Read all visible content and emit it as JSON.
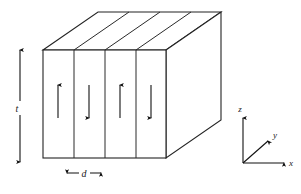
{
  "figure": {
    "type": "magnetic-domain-slab-diagram",
    "background_color": "#ffffff",
    "line_color": "#232323"
  },
  "labels": {
    "thickness": "t",
    "domain_width": "d",
    "axis_x": "x",
    "axis_y": "y",
    "axis_z": "z"
  },
  "slab": {
    "front_face": {
      "left_x": 43,
      "right_x": 166,
      "top_y": 50,
      "bottom_y": 158
    },
    "depth_offset": {
      "dx": 55,
      "dy": -38
    },
    "domain_boundaries_x": [
      43,
      74,
      105,
      136,
      166
    ],
    "domain_count": 4
  },
  "domains": [
    {
      "index": 1,
      "center_x": 58,
      "direction": "up",
      "arrow_symbol": "↑"
    },
    {
      "index": 2,
      "center_x": 89,
      "direction": "down",
      "arrow_symbol": "↓"
    },
    {
      "index": 3,
      "center_x": 120,
      "direction": "up",
      "arrow_symbol": "↑"
    },
    {
      "index": 4,
      "center_x": 151,
      "direction": "down",
      "arrow_symbol": "↓"
    }
  ],
  "dimension_markers": {
    "thickness_arrow": {
      "label": "t",
      "orientation": "vertical",
      "double_headed": true,
      "x": 20,
      "top_y": 46,
      "bottom_y": 166,
      "label_x": 14,
      "label_y": 109
    },
    "width_arrow": {
      "label": "d",
      "orientation": "horizontal",
      "double_headed": true,
      "y": 173,
      "left_x": 64,
      "right_x": 104,
      "label_x": 84,
      "label_y": 177
    }
  },
  "axes": {
    "origin": {
      "x": 243,
      "y": 163
    },
    "x_axis": {
      "end_x": 287,
      "end_y": 163,
      "label": "x",
      "label_x": 292,
      "label_y": 166
    },
    "y_axis": {
      "end_x": 270,
      "end_y": 139,
      "label": "y",
      "label_x": 274,
      "label_y": 137
    },
    "z_axis": {
      "end_x": 243,
      "end_y": 115,
      "label": "z",
      "label_x": 240,
      "label_y": 110
    }
  }
}
